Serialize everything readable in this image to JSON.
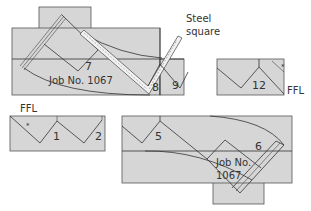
{
  "colors": {
    "panel_fill": "#d6d6d6",
    "stroke": "#333333",
    "steel_square_fill": "#f2f2f2",
    "text": "#333333",
    "background": "#ffffff"
  },
  "labels": {
    "steel_square_line1": "Steel",
    "steel_square_line2": "square",
    "ffl_top_right": "FFL",
    "ffl_bottom_left": "FFL",
    "job_top": "Job No. 1067",
    "job_bottom_line1": "Job No.",
    "job_bottom_line2": "1067",
    "star_mark": "*"
  },
  "steps": {
    "s1": "1",
    "s2": "2",
    "s5": "5",
    "s6": "6",
    "s7": "7",
    "s8": "8",
    "s9": "9",
    "s12": "12"
  }
}
